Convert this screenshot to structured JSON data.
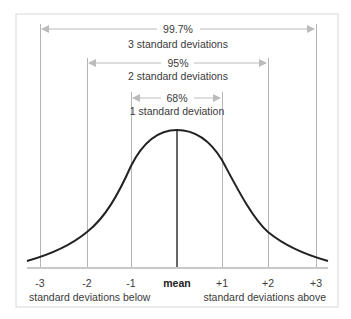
{
  "diagram": {
    "ranges": [
      {
        "percent": "99.7%",
        "label": "3 standard deviations",
        "from": -3,
        "to": 3
      },
      {
        "percent": "95%",
        "label": "2 standard deviations",
        "from": -2,
        "to": 2
      },
      {
        "percent": "68%",
        "label": "1 standard deviation",
        "from": -1,
        "to": 1
      }
    ],
    "axis": {
      "ticks": [
        "-3",
        "-2",
        "-1",
        "mean",
        "+1",
        "+2",
        "+3"
      ],
      "below_label": "standard deviations below",
      "above_label": "standard deviations above"
    }
  },
  "colors": {
    "curve": "#222222",
    "mean_line": "#333333",
    "sd_lines": "#aaaaaa",
    "arrows": "#bbbbbb",
    "frame": "#d8d8d8",
    "text": "#3a3a3a"
  }
}
